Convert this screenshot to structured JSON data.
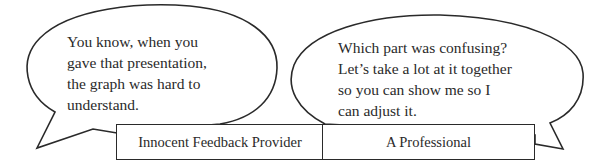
{
  "diagram": {
    "type": "speech-bubble-dialogue",
    "stroke_color": "#2a2a2a",
    "background_color": "#ffffff",
    "speakers": [
      {
        "role": "Innocent Feedback Provider",
        "position": "left",
        "speech_lines": [
          "You know, when you",
          "gave that presentation,",
          "the graph was hard to",
          "understand."
        ]
      },
      {
        "role": "A Professional",
        "position": "right",
        "speech_lines": [
          "Which part was confusing?",
          "Let’s take a lot at it together",
          "so you can show me so I",
          "can adjust it."
        ]
      }
    ]
  }
}
